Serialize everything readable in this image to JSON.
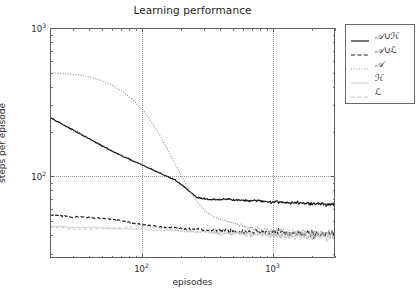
{
  "chart_data": {
    "type": "line",
    "title": "Learning performance",
    "xlabel": "episodes",
    "ylabel": "steps per episode",
    "xscale": "log",
    "yscale": "log",
    "xlim": [
      20,
      3000
    ],
    "ylim": [
      28,
      1000
    ],
    "grid": true,
    "legend_position": "upper right (outside axes)",
    "xticks": [
      100,
      1000
    ],
    "xtick_labels": [
      "10²",
      "10³"
    ],
    "yticks": [
      100,
      1000
    ],
    "ytick_labels": [
      "10²",
      "10³"
    ],
    "series": [
      {
        "name": "A∪H",
        "label_base": "A",
        "label_op": "∪",
        "label_sub": "H",
        "style": "solid",
        "color": "#1a1a1a",
        "width": 1.2,
        "x": [
          20,
          24,
          29,
          35,
          42,
          50,
          60,
          72,
          87,
          105,
          126,
          151,
          181,
          218,
          262,
          315,
          378,
          454,
          545,
          655,
          787,
          945,
          1135,
          1363,
          1637,
          1966,
          2361,
          2836
        ],
        "y": [
          250,
          228,
          208,
          190,
          174,
          160,
          147,
          136,
          126,
          117,
          109,
          101,
          94,
          83,
          72,
          70,
          69,
          70,
          69,
          68,
          68,
          67,
          67,
          66,
          66,
          65,
          65,
          64
        ]
      },
      {
        "name": "A∪L",
        "label_base": "A",
        "label_op": "∪",
        "label_sub": "L",
        "style": "dashed",
        "color": "#1a1a1a",
        "width": 1.1,
        "x": [
          20,
          24,
          29,
          35,
          42,
          50,
          60,
          72,
          87,
          105,
          126,
          151,
          181,
          218,
          262,
          315,
          378,
          454,
          545,
          655,
          787,
          945,
          1135,
          1363,
          1637,
          1966,
          2361,
          2836
        ],
        "y": [
          55,
          54,
          53,
          53,
          52,
          52,
          51,
          50,
          48,
          47,
          46,
          45,
          45,
          44,
          44,
          43,
          43,
          43,
          42,
          42,
          42,
          42,
          42,
          41,
          41,
          41,
          41,
          41
        ]
      },
      {
        "name": "A",
        "label_base": "A",
        "label_op": "",
        "label_sub": "",
        "style": "dotted",
        "color": "#909090",
        "width": 1.1,
        "x": [
          20,
          24,
          29,
          35,
          42,
          50,
          60,
          72,
          87,
          105,
          126,
          151,
          181,
          218,
          262,
          315,
          378,
          454,
          545,
          655,
          787,
          945,
          1135,
          1363,
          1637,
          1966,
          2361,
          2836
        ],
        "y": [
          500,
          495,
          488,
          478,
          462,
          440,
          410,
          372,
          325,
          272,
          216,
          163,
          120,
          88,
          68,
          57,
          52,
          49,
          47,
          45,
          44,
          43,
          43,
          42,
          42,
          42,
          41,
          41
        ]
      },
      {
        "name": "H",
        "label_base": "H",
        "label_op": "",
        "label_sub": "",
        "style": "thin-solid",
        "color": "#bcbcbc",
        "width": 0.8,
        "x": [
          20,
          24,
          29,
          35,
          42,
          50,
          60,
          72,
          87,
          105,
          126,
          151,
          181,
          218,
          262,
          315,
          378,
          454,
          545,
          655,
          787,
          945,
          1135,
          1363,
          1637,
          1966,
          2361,
          2836
        ],
        "y": [
          46,
          46,
          45,
          45,
          45,
          45,
          44,
          44,
          44,
          44,
          43,
          43,
          43,
          42,
          42,
          42,
          42,
          41,
          41,
          41,
          41,
          40,
          40,
          40,
          40,
          40,
          40,
          39
        ]
      },
      {
        "name": "L",
        "label_base": "L",
        "label_op": "",
        "label_sub": "",
        "style": "light-dashed",
        "color": "#c4c4c4",
        "width": 1.0,
        "x": [
          20,
          24,
          29,
          35,
          42,
          50,
          60,
          72,
          87,
          105,
          126,
          151,
          181,
          218,
          262,
          315,
          378,
          454,
          545,
          655,
          787,
          945,
          1135,
          1363,
          1637,
          1966,
          2361,
          2836
        ],
        "y": [
          45,
          45,
          44,
          44,
          44,
          44,
          45,
          45,
          46,
          46,
          45,
          44,
          43,
          43,
          42,
          42,
          41,
          41,
          41,
          40,
          40,
          40,
          40,
          39,
          39,
          39,
          39,
          38
        ]
      }
    ]
  },
  "legend": {
    "entries": [
      {
        "text": "𝒜∪ℋ"
      },
      {
        "text": "𝒜∪ℒ"
      },
      {
        "text": "𝒜"
      },
      {
        "text": "ℋ"
      },
      {
        "text": "ℒ"
      }
    ]
  }
}
